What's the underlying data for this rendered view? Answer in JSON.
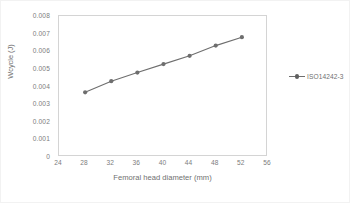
{
  "chart_data": {
    "type": "line",
    "title": "",
    "xlabel": "Femoral head diameter (mm)",
    "ylabel": "Wcycle (J)",
    "xlim": [
      24,
      56
    ],
    "ylim": [
      0,
      0.008
    ],
    "grid": false,
    "legend_position": "right",
    "x_ticks": [
      "24",
      "28",
      "32",
      "36",
      "40",
      "44",
      "48",
      "52",
      "56"
    ],
    "y_ticks": [
      "0",
      "0.001",
      "0.002",
      "0.003",
      "0.004",
      "0.005",
      "0.006",
      "0.007",
      "0.008"
    ],
    "x": [
      28,
      32,
      36,
      40,
      44,
      48,
      52
    ],
    "series": [
      {
        "name": "ISO14242-3",
        "color": "#6e6e6e",
        "marker": "circle",
        "values": [
          0.00367,
          0.0043,
          0.00479,
          0.00527,
          0.00574,
          0.00632,
          0.0068
        ]
      }
    ]
  },
  "legend": {
    "entries": [
      {
        "label": "ISO14242-3"
      }
    ]
  },
  "axes": {
    "x_title": "Femoral head diameter (mm)",
    "y_title": "Wcycle (J)"
  }
}
